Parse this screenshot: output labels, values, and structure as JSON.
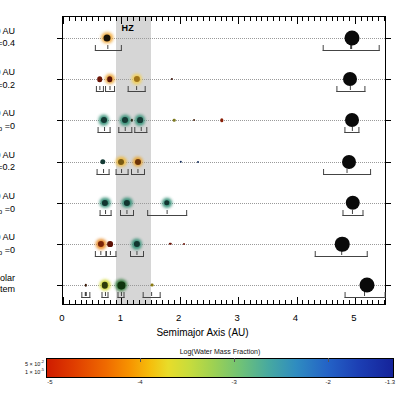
{
  "figure": {
    "hz_label": "HZ",
    "hz_range_au": [
      0.9,
      1.5
    ]
  },
  "chart_data": {
    "type": "scatter",
    "title": "",
    "xlabel": "Semimajor Axis (AU)",
    "ylabel": "",
    "xlim": [
      0,
      5.55
    ],
    "xticks": [
      0,
      1,
      2,
      3,
      4,
      5
    ],
    "xtick_labels": [
      "0",
      "1",
      "2",
      "3",
      "4",
      "5"
    ],
    "minor_tick_step": 0.1,
    "grid": "dotted-row-guides",
    "legend": "none",
    "annotations": [
      "HZ"
    ],
    "marker_size_encodes": "planet mass",
    "marker_color_encodes": "Log(Water Mass Fraction)",
    "error_bars": "perihelion-aphelion range (eccentricity)",
    "rows": [
      {
        "id": "ab40-eb04",
        "label_lines": [
          "a_b =40 AU",
          "e_b =0.4"
        ],
        "planets": [
          {
            "a": 0.76,
            "size": 7.0,
            "color": "#1a1208",
            "halo": "#f0a83a",
            "e_lo": 0.55,
            "e_hi": 1.0
          },
          {
            "a": 4.95,
            "size": 15.0,
            "color": "#0a0a0a",
            "halo": "",
            "e_lo": 4.45,
            "e_hi": 5.42
          }
        ]
      },
      {
        "id": "ab40-eb02",
        "label_lines": [
          "a_b =40 AU",
          "e_b =0.2"
        ],
        "planets": [
          {
            "a": 0.63,
            "size": 5.6,
            "color": "#6b1508",
            "halo": "",
            "e_lo": 0.56,
            "e_hi": 0.7
          },
          {
            "a": 0.8,
            "size": 5.6,
            "color": "#5a1206",
            "halo": "#e8a030",
            "e_lo": 0.72,
            "e_hi": 0.89
          },
          {
            "a": 1.26,
            "size": 6.2,
            "color": "#a07418",
            "halo": "#f2cf55",
            "e_lo": 1.1,
            "e_hi": 1.42
          },
          {
            "a": 1.86,
            "size": 2.2,
            "color": "#3a1108",
            "halo": "",
            "e_lo": 0,
            "e_hi": 0
          },
          {
            "a": 4.92,
            "size": 14.0,
            "color": "#0a0a0a",
            "halo": "",
            "e_lo": 4.68,
            "e_hi": 5.18
          }
        ]
      },
      {
        "id": "ab40-eb0",
        "label_lines": [
          "a_b =40 AU",
          "e_b =0"
        ],
        "planets": [
          {
            "a": 0.7,
            "size": 6.0,
            "color": "#143a34",
            "halo": "#2f8f74",
            "e_lo": 0.6,
            "e_hi": 0.82
          },
          {
            "a": 1.07,
            "size": 6.0,
            "color": "#143a34",
            "halo": "#2f8f74",
            "e_lo": 0.95,
            "e_hi": 1.18
          },
          {
            "a": 1.18,
            "size": 2.3,
            "color": "#2a2a18",
            "halo": "",
            "e_lo": 0,
            "e_hi": 0
          },
          {
            "a": 1.32,
            "size": 5.8,
            "color": "#143a34",
            "halo": "#2f8f74",
            "e_lo": 1.22,
            "e_hi": 1.45
          },
          {
            "a": 1.9,
            "size": 2.6,
            "color": "#7d7a20",
            "halo": "",
            "e_lo": 0,
            "e_hi": 0
          },
          {
            "a": 2.24,
            "size": 1.9,
            "color": "#4a2410",
            "halo": "",
            "e_lo": 0,
            "e_hi": 0
          },
          {
            "a": 2.72,
            "size": 3.4,
            "color": "#8a2008",
            "halo": "",
            "e_lo": 0,
            "e_hi": 0
          },
          {
            "a": 4.95,
            "size": 14.0,
            "color": "#0a0a0a",
            "halo": "",
            "e_lo": 4.82,
            "e_hi": 5.08
          }
        ]
      },
      {
        "id": "ab30-eb02",
        "label_lines": [
          "a_b =30 AU",
          "e_b =0.2"
        ],
        "planets": [
          {
            "a": 0.68,
            "size": 5.4,
            "color": "#143a34",
            "halo": "",
            "e_lo": 0.58,
            "e_hi": 0.8
          },
          {
            "a": 1.0,
            "size": 6.0,
            "color": "#7a5a12",
            "halo": "#efb93c",
            "e_lo": 0.9,
            "e_hi": 1.12
          },
          {
            "a": 1.28,
            "size": 6.0,
            "color": "#6b3208",
            "halo": "#e8a42c",
            "e_lo": 1.16,
            "e_hi": 1.4
          },
          {
            "a": 2.02,
            "size": 2.4,
            "color": "#16305e",
            "halo": "",
            "e_lo": 0,
            "e_hi": 0
          },
          {
            "a": 2.32,
            "size": 2.0,
            "color": "#16305e",
            "halo": "",
            "e_lo": 0,
            "e_hi": 0
          },
          {
            "a": 4.9,
            "size": 14.0,
            "color": "#0a0a0a",
            "halo": "",
            "e_lo": 4.46,
            "e_hi": 5.28
          }
        ]
      },
      {
        "id": "ab30-eb0",
        "label_lines": [
          "a_b =30 AU",
          "e_b =0"
        ],
        "planets": [
          {
            "a": 0.72,
            "size": 6.2,
            "color": "#123530",
            "halo": "#2a8a70",
            "e_lo": 0.62,
            "e_hi": 0.84
          },
          {
            "a": 1.1,
            "size": 6.2,
            "color": "#123530",
            "halo": "#2a8a70",
            "e_lo": 0.98,
            "e_hi": 1.22
          },
          {
            "a": 1.78,
            "size": 5.4,
            "color": "#123530",
            "halo": "#2a8a70",
            "e_lo": 1.44,
            "e_hi": 2.12
          },
          {
            "a": 4.96,
            "size": 14.5,
            "color": "#0a0a0a",
            "halo": "",
            "e_lo": 4.78,
            "e_hi": 5.14
          }
        ]
      },
      {
        "id": "ab20-eb0",
        "label_lines": [
          "a_b =20 AU",
          "e_b =0"
        ],
        "planets": [
          {
            "a": 0.65,
            "size": 6.2,
            "color": "#7a2408",
            "halo": "#e88a24",
            "e_lo": 0.55,
            "e_hi": 0.76
          },
          {
            "a": 0.81,
            "size": 5.8,
            "color": "#5e1206",
            "halo": "",
            "e_lo": 0.72,
            "e_hi": 0.91
          },
          {
            "a": 1.26,
            "size": 6.2,
            "color": "#123530",
            "halo": "#2a8a70",
            "e_lo": 1.14,
            "e_hi": 1.38
          },
          {
            "a": 1.84,
            "size": 2.4,
            "color": "#6b1508",
            "halo": "",
            "e_lo": 0,
            "e_hi": 0
          },
          {
            "a": 2.08,
            "size": 2.0,
            "color": "#6b1508",
            "halo": "",
            "e_lo": 0,
            "e_hi": 0
          },
          {
            "a": 4.78,
            "size": 14.5,
            "color": "#0a0a0a",
            "halo": "",
            "e_lo": 4.32,
            "e_hi": 5.22
          }
        ]
      },
      {
        "id": "solar-system",
        "label_lines": [
          "Solar",
          "System"
        ],
        "planets": [
          {
            "a": 0.39,
            "size": 2.4,
            "color": "#3a1a08",
            "halo": "",
            "e_lo": 0.31,
            "e_hi": 0.47
          },
          {
            "a": 0.72,
            "size": 6.4,
            "color": "#2d3a0a",
            "halo": "#cfd52e",
            "e_lo": 0.66,
            "e_hi": 0.78
          },
          {
            "a": 1.0,
            "size": 7.2,
            "color": "#10350e",
            "halo": "#2f7a38",
            "e_lo": 0.94,
            "e_hi": 1.06
          },
          {
            "a": 1.52,
            "size": 2.8,
            "color": "#8a7a12",
            "halo": "",
            "e_lo": 1.36,
            "e_hi": 1.68
          },
          {
            "a": 5.2,
            "size": 15.0,
            "color": "#0a0a0a",
            "halo": "",
            "e_lo": 4.82,
            "e_hi": 5.52
          }
        ]
      }
    ]
  },
  "colorbar": {
    "title": "Log(Water Mass Fraction)",
    "ticks": [
      -5,
      -4,
      -3,
      -2,
      -1.3
    ],
    "tick_labels": [
      "-5",
      "-4",
      "-3",
      "-2",
      "-1.3"
    ],
    "range": [
      -5,
      -1.3
    ],
    "size_legend": [
      {
        "label": "5 × 10",
        "exp": "-2"
      },
      {
        "label": "1 × 10",
        "exp": "-5"
      }
    ]
  }
}
